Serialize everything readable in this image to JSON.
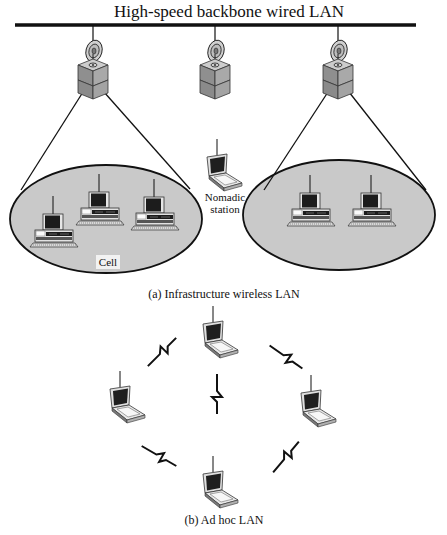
{
  "title": "High-speed backbone wired LAN",
  "infrastructure": {
    "caption": "(a) Infrastructure wireless LAN",
    "cell_label": "Cell",
    "nomadic_label_line1": "Nomadic",
    "nomadic_label_line2": "station",
    "access_points": [
      {
        "name": "access-point-left",
        "x": 93
      },
      {
        "name": "access-point-center",
        "x": 215
      },
      {
        "name": "access-point-right",
        "x": 338
      }
    ],
    "cells": [
      {
        "name": "cell-left",
        "cx": 106,
        "cy": 219,
        "rx": 96,
        "ry": 54,
        "stations": 3
      },
      {
        "name": "cell-right",
        "cx": 339,
        "cy": 215,
        "rx": 96,
        "ry": 55,
        "stations": 2
      }
    ]
  },
  "adhoc": {
    "caption": "(b) Ad hoc LAN",
    "stations": 5
  },
  "colors": {
    "line": "#111111",
    "cell_fill": "#c9c9c9",
    "device_gray": "#9a9a9a",
    "device_light": "#d4d4d4",
    "screen": "#1c1c1c"
  }
}
